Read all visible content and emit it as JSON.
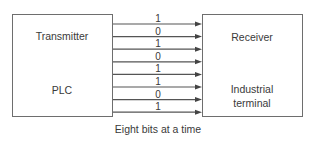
{
  "diagram": {
    "transmitter": {
      "title": "Transmitter",
      "subtitle": "PLC"
    },
    "receiver": {
      "title": "Receiver",
      "subtitle_line1": "Industrial",
      "subtitle_line2": "terminal"
    },
    "bits": [
      "1",
      "0",
      "1",
      "0",
      "1",
      "1",
      "0",
      "1"
    ],
    "caption": "Eight bits at a time",
    "colors": {
      "stroke": "#6e6e6e",
      "text": "#3a3a3a"
    }
  }
}
